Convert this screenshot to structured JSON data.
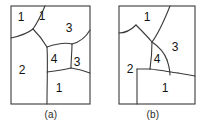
{
  "figure": {
    "panels": [
      {
        "id": "a",
        "caption": "(a)",
        "frame": {
          "x": 11,
          "y": 6,
          "width": 79,
          "height": 98
        },
        "region_labels": [
          {
            "name": "region-label-1-topleft",
            "text": "1",
            "x": 21,
            "y": 18
          },
          {
            "name": "region-label-1-topmid",
            "text": "1",
            "x": 42,
            "y": 17
          },
          {
            "name": "region-label-3-topright",
            "text": "3",
            "x": 69,
            "y": 29
          },
          {
            "name": "region-label-4-center",
            "text": "4",
            "x": 54,
            "y": 60
          },
          {
            "name": "region-label-3-right",
            "text": "3",
            "x": 77,
            "y": 63
          },
          {
            "name": "region-label-2-left",
            "text": "2",
            "x": 22,
            "y": 71
          },
          {
            "name": "region-label-1-bottom",
            "text": "1",
            "x": 59,
            "y": 89
          }
        ],
        "partition_paths": [
          "M 11 38 C 20 36 27 34 33 29",
          "M 33 29 C 38 22 42 13 45 6",
          "M 33 29 C 38 34 43 40 47 47",
          "M 47 47 C 48 62 47 80 47 104",
          "M 47 47 C 56 44 64 42 72 44",
          "M 72 44 C 80 42 86 37 90 30",
          "M 72 44 C 72 52 71 60 71 68",
          "M 47 72 C 56 71 64 70 71 68",
          "M 71 68 C 78 69 85 71 90 73"
        ]
      },
      {
        "id": "b",
        "caption": "(b)",
        "frame": {
          "x": 119,
          "y": 6,
          "width": 76,
          "height": 98
        },
        "region_labels": [
          {
            "name": "region-label-1-top",
            "text": "1",
            "x": 147,
            "y": 18
          },
          {
            "name": "region-label-3-right",
            "text": "3",
            "x": 175,
            "y": 48
          },
          {
            "name": "region-label-4-center",
            "text": "4",
            "x": 157,
            "y": 60
          },
          {
            "name": "region-label-2-left",
            "text": "2",
            "x": 130,
            "y": 70
          },
          {
            "name": "region-label-1-bottom",
            "text": "1",
            "x": 165,
            "y": 89
          }
        ],
        "partition_paths": [
          "M 119 33 C 126 33 131 30 136 25",
          "M 136 25 C 141 30 147 36 152 42",
          "M 152 42 C 158 34 164 21 170 6",
          "M 152 42 C 158 46 164 52 167 60",
          "M 167 60 C 169 66 170 71 170 75",
          "M 152 42 C 152 52 151 62 150 69",
          "M 150 69 C 143 69 137 69 137 69",
          "M 137 69 C 137 82 137 93 137 104",
          "M 150 69 C 160 70 170 72 178 73",
          "M 178 73 C 184 74 190 75 195 76"
        ]
      }
    ]
  }
}
